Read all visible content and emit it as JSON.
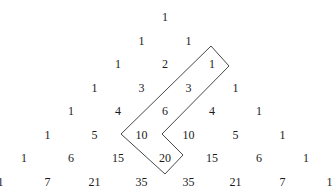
{
  "rows": [
    [
      "1"
    ],
    [
      "1",
      "1"
    ],
    [
      "1",
      "2",
      "1"
    ],
    [
      "1",
      "3",
      "3",
      "1"
    ],
    [
      "1",
      "4",
      "6",
      "4",
      "1"
    ],
    [
      "1",
      "5",
      "10",
      "10",
      "5",
      "1"
    ],
    [
      "1",
      "6",
      "15",
      "20",
      "15",
      "6",
      "1"
    ],
    [
      "1",
      "7",
      "21",
      "35",
      "35",
      "21",
      "7",
      "1"
    ]
  ],
  "highlight": {
    "description": "Hockey-stick outline around 1, 3, 6, 10 pointing to 20... enclosing 1,3,6,10,20",
    "cells": [
      "1",
      "3",
      "6",
      "10",
      "20"
    ],
    "stroke_color": "#333333"
  },
  "colors": {
    "text": "#1a1a1a",
    "background": "#ffffff"
  }
}
